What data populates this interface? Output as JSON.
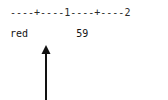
{
  "canvas": {
    "width": 168,
    "height": 100,
    "background": "#ffffff",
    "foreground": "#1a1a1a"
  },
  "ruler": {
    "text": "----+----1----+----2",
    "tick_marks": [
      "+",
      "1",
      "+",
      "2"
    ],
    "tick_columns": [
      5,
      10,
      15,
      20
    ],
    "segment_char": "-",
    "segment_length": 4
  },
  "content": {
    "label": "red",
    "label_column": 1,
    "value": "59",
    "value_column": 12,
    "line": "red        59"
  },
  "arrow": {
    "direction": "up",
    "points_to_column": 5,
    "color": "#121212",
    "shaft_width": 2,
    "head_width": 9,
    "head_height": 9
  }
}
